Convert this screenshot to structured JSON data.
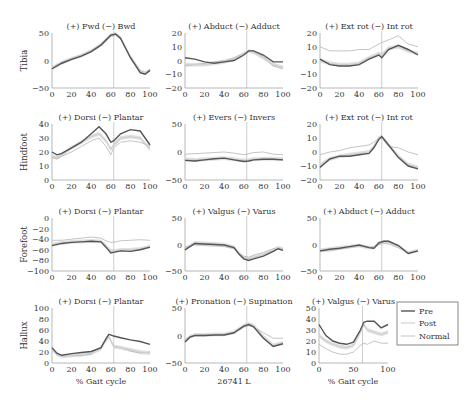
{
  "figure": {
    "row_labels": [
      "Tibia",
      "Hindfoot",
      "Forefoot",
      "Hallux"
    ],
    "x_label": "% Gait cycle",
    "center_caption": "26741 L",
    "legend": [
      {
        "label": "Pre",
        "color": "#555555"
      },
      {
        "label": "Post",
        "color": "#d0d0d0"
      },
      {
        "label": "Normal",
        "color": "#b5b5b5"
      }
    ],
    "toe_off_line_x": 63
  },
  "chart_data": [
    {
      "type": "line",
      "segment": "Tibia",
      "title": "(+) Fwd (−) Bwd",
      "xlabel": "",
      "ylabel": "Tibia",
      "xlim": [
        0,
        100
      ],
      "ylim": [
        -50,
        50
      ],
      "xticks": [
        0,
        20,
        40,
        60,
        80,
        100
      ],
      "yticks": [
        50,
        0,
        -50
      ],
      "x": [
        0,
        10,
        20,
        30,
        40,
        50,
        60,
        65,
        70,
        80,
        90,
        95,
        100
      ],
      "series": [
        {
          "name": "Pre",
          "values": [
            -15,
            -5,
            2,
            8,
            16,
            28,
            46,
            48,
            40,
            5,
            -22,
            -25,
            -18
          ]
        },
        {
          "name": "Post",
          "values": [
            -14,
            -4,
            3,
            9,
            17,
            29,
            46,
            48,
            41,
            6,
            -20,
            -23,
            -17
          ]
        },
        {
          "name": "Normal",
          "values": [
            -13,
            -3,
            4,
            10,
            18,
            30,
            45,
            47,
            40,
            8,
            -18,
            -22,
            -16
          ]
        }
      ]
    },
    {
      "type": "line",
      "segment": "Tibia",
      "title": "(+) Abduct (−) Adduct",
      "xlabel": "",
      "ylabel": "",
      "xlim": [
        0,
        100
      ],
      "ylim": [
        -20,
        20
      ],
      "xticks": [
        0,
        20,
        40,
        60,
        80,
        100
      ],
      "yticks": [
        20,
        10,
        0,
        -10,
        -20
      ],
      "x": [
        0,
        10,
        20,
        30,
        40,
        50,
        60,
        65,
        70,
        80,
        90,
        100
      ],
      "series": [
        {
          "name": "Pre",
          "values": [
            2,
            1,
            -1,
            -2,
            -1,
            0,
            4,
            7,
            7,
            4,
            -1,
            -1
          ]
        },
        {
          "name": "Post",
          "values": [
            -3,
            -3,
            -3,
            -2,
            -1,
            1,
            5,
            7,
            6,
            2,
            -3,
            -5
          ]
        },
        {
          "name": "Normal",
          "values": [
            -4,
            -3,
            -2,
            -1,
            0,
            2,
            5,
            7,
            7,
            3,
            -4,
            -6
          ]
        }
      ]
    },
    {
      "type": "line",
      "segment": "Tibia",
      "title": "(+) Ext rot (−) Int rot",
      "xlabel": "",
      "ylabel": "",
      "xlim": [
        0,
        100
      ],
      "ylim": [
        -20,
        20
      ],
      "xticks": [
        0,
        20,
        40,
        60,
        80,
        100
      ],
      "yticks": [
        20,
        10,
        0,
        -10,
        -20
      ],
      "x": [
        0,
        10,
        20,
        30,
        40,
        50,
        60,
        63,
        70,
        80,
        90,
        100
      ],
      "series": [
        {
          "name": "Pre",
          "values": [
            1,
            -3,
            -4,
            -4,
            -3,
            1,
            4,
            2,
            8,
            11,
            8,
            4
          ]
        },
        {
          "name": "Post",
          "values": [
            0,
            -2,
            -3,
            -3,
            -2,
            2,
            5,
            4,
            9,
            10,
            7,
            5
          ]
        },
        {
          "name": "Normal",
          "values": [
            10,
            7,
            7,
            7,
            8,
            8,
            12,
            13,
            15,
            18,
            12,
            10
          ]
        }
      ]
    },
    {
      "type": "line",
      "segment": "Hindfoot",
      "title": "(+) Dorsi (−) Plantar",
      "xlabel": "",
      "ylabel": "Hindfoot",
      "xlim": [
        0,
        100
      ],
      "ylim": [
        0,
        40
      ],
      "xticks": [
        0,
        20,
        40,
        60,
        80,
        100
      ],
      "yticks": [
        40,
        30,
        20,
        10,
        0
      ],
      "x": [
        0,
        5,
        10,
        20,
        30,
        40,
        48,
        55,
        60,
        63,
        70,
        80,
        90,
        100
      ],
      "series": [
        {
          "name": "Pre",
          "values": [
            20,
            18,
            19,
            23,
            27,
            33,
            38,
            33,
            27,
            28,
            33,
            36,
            35,
            25
          ]
        },
        {
          "name": "Post",
          "values": [
            17,
            16,
            18,
            23,
            27,
            31,
            33,
            28,
            22,
            25,
            30,
            31,
            30,
            22
          ]
        },
        {
          "name": "Normal",
          "values": [
            16,
            15,
            17,
            20,
            24,
            28,
            30,
            24,
            18,
            23,
            27,
            28,
            27,
            24
          ]
        }
      ]
    },
    {
      "type": "line",
      "segment": "Hindfoot",
      "title": "(+) Evers (−) Invers",
      "xlabel": "",
      "ylabel": "",
      "xlim": [
        0,
        100
      ],
      "ylim": [
        -50,
        50
      ],
      "xticks": [
        0,
        20,
        40,
        60,
        80,
        100
      ],
      "yticks": [
        50,
        0,
        -50
      ],
      "x": [
        0,
        10,
        20,
        30,
        40,
        50,
        60,
        65,
        70,
        80,
        90,
        100
      ],
      "series": [
        {
          "name": "Pre",
          "values": [
            -15,
            -16,
            -14,
            -12,
            -11,
            -14,
            -17,
            -16,
            -14,
            -13,
            -13,
            -14
          ]
        },
        {
          "name": "Post",
          "values": [
            -13,
            -14,
            -13,
            -12,
            -11,
            -13,
            -15,
            -14,
            -13,
            -12,
            -12,
            -13
          ]
        },
        {
          "name": "Normal",
          "values": [
            -4,
            -3,
            -2,
            -1,
            0,
            -2,
            -5,
            -3,
            -1,
            0,
            -4,
            -5
          ]
        }
      ]
    },
    {
      "type": "line",
      "segment": "Hindfoot",
      "title": "(+) Ext rot (−) Int rot",
      "xlabel": "",
      "ylabel": "",
      "xlim": [
        0,
        100
      ],
      "ylim": [
        -20,
        20
      ],
      "xticks": [
        0,
        20,
        40,
        60,
        80,
        100
      ],
      "yticks": [
        20,
        10,
        0,
        -10,
        -20
      ],
      "x": [
        0,
        5,
        10,
        20,
        30,
        40,
        50,
        55,
        60,
        63,
        70,
        80,
        90,
        100
      ],
      "series": [
        {
          "name": "Pre",
          "values": [
            -11,
            -8,
            -5,
            -3,
            -3,
            -2,
            -1,
            3,
            9,
            11,
            5,
            -4,
            -10,
            -12
          ]
        },
        {
          "name": "Post",
          "values": [
            -10,
            -7,
            -5,
            -3,
            -2,
            -1,
            0,
            4,
            10,
            11,
            5,
            -3,
            -9,
            -11
          ]
        },
        {
          "name": "Normal",
          "values": [
            -2,
            -1,
            0,
            1,
            3,
            4,
            5,
            7,
            10,
            10,
            4,
            3,
            0,
            -2
          ]
        }
      ]
    },
    {
      "type": "line",
      "segment": "Forefoot",
      "title": "(+) Dorsi (−) Plantar",
      "xlabel": "",
      "ylabel": "Forefoot",
      "xlim": [
        0,
        100
      ],
      "ylim": [
        -100,
        0
      ],
      "xticks": [
        0,
        20,
        40,
        60,
        80,
        100
      ],
      "yticks": [
        0,
        -20,
        -40,
        -60,
        -80,
        -100
      ],
      "x": [
        0,
        10,
        20,
        30,
        40,
        50,
        55,
        60,
        65,
        70,
        80,
        90,
        100
      ],
      "series": [
        {
          "name": "Pre",
          "values": [
            -52,
            -48,
            -46,
            -45,
            -44,
            -45,
            -55,
            -66,
            -64,
            -62,
            -63,
            -60,
            -55
          ]
        },
        {
          "name": "Post",
          "values": [
            -50,
            -47,
            -45,
            -44,
            -43,
            -44,
            -52,
            -62,
            -62,
            -60,
            -60,
            -58,
            -54
          ]
        },
        {
          "name": "Normal",
          "values": [
            -42,
            -42,
            -40,
            -38,
            -36,
            -38,
            -43,
            -46,
            -45,
            -43,
            -42,
            -41,
            -42
          ]
        }
      ]
    },
    {
      "type": "line",
      "segment": "Forefoot",
      "title": "(+) Valgus (−) Varus",
      "xlabel": "",
      "ylabel": "",
      "xlim": [
        0,
        100
      ],
      "ylim": [
        -50,
        50
      ],
      "xticks": [
        0,
        20,
        40,
        60,
        80,
        100
      ],
      "yticks": [
        50,
        0,
        -50
      ],
      "x": [
        0,
        10,
        20,
        30,
        40,
        50,
        55,
        60,
        65,
        70,
        80,
        90,
        95,
        100
      ],
      "series": [
        {
          "name": "Pre",
          "values": [
            -10,
            2,
            1,
            0,
            -1,
            -6,
            -18,
            -27,
            -30,
            -27,
            -22,
            -13,
            -8,
            -11
          ]
        },
        {
          "name": "Post",
          "values": [
            -8,
            3,
            2,
            1,
            0,
            -5,
            -16,
            -25,
            -27,
            -24,
            -19,
            -11,
            -6,
            -9
          ]
        },
        {
          "name": "Normal",
          "values": [
            -5,
            -1,
            -2,
            -3,
            -4,
            -8,
            -17,
            -22,
            -24,
            -20,
            -15,
            -8,
            -6,
            -8
          ]
        }
      ]
    },
    {
      "type": "line",
      "segment": "Forefoot",
      "title": "(+) Abduct (−) Adduct",
      "xlabel": "",
      "ylabel": "",
      "xlim": [
        0,
        100
      ],
      "ylim": [
        -50,
        50
      ],
      "xticks": [
        0,
        20,
        40,
        60,
        80,
        100
      ],
      "yticks": [
        50,
        0,
        -50
      ],
      "x": [
        0,
        10,
        20,
        30,
        40,
        50,
        55,
        60,
        65,
        70,
        80,
        90,
        100
      ],
      "series": [
        {
          "name": "Pre",
          "values": [
            -12,
            -9,
            -7,
            -4,
            -1,
            -6,
            -7,
            3,
            6,
            6,
            -2,
            -17,
            -12
          ]
        },
        {
          "name": "Post",
          "values": [
            -11,
            -8,
            -6,
            -4,
            -2,
            -6,
            -6,
            2,
            5,
            5,
            -3,
            -16,
            -11
          ]
        },
        {
          "name": "Normal",
          "values": [
            -13,
            -12,
            -9,
            -6,
            -3,
            -5,
            -5,
            0,
            2,
            1,
            -6,
            -16,
            -12
          ]
        }
      ]
    },
    {
      "type": "line",
      "segment": "Hallux",
      "title": "(+) Dorsi (−) Plantar",
      "xlabel": "% Gait cycle",
      "ylabel": "Hallux",
      "xlim": [
        0,
        100
      ],
      "ylim": [
        0,
        100
      ],
      "xticks": [
        0,
        20,
        40,
        60,
        80,
        100
      ],
      "yticks": [
        100,
        80,
        60,
        40,
        20,
        0
      ],
      "x": [
        0,
        5,
        10,
        20,
        30,
        40,
        50,
        55,
        58,
        63,
        70,
        80,
        90,
        100
      ],
      "series": [
        {
          "name": "Pre",
          "values": [
            28,
            18,
            14,
            17,
            19,
            21,
            28,
            44,
            52,
            49,
            46,
            42,
            39,
            34
          ]
        },
        {
          "name": "Post",
          "values": [
            26,
            16,
            12,
            14,
            15,
            18,
            26,
            42,
            48,
            30,
            28,
            24,
            20,
            18
          ]
        },
        {
          "name": "Normal",
          "values": [
            25,
            15,
            13,
            13,
            14,
            16,
            28,
            40,
            47,
            30,
            28,
            22,
            18,
            20
          ]
        }
      ]
    },
    {
      "type": "line",
      "segment": "Hallux",
      "title": "(+) Pronation (−) Supination",
      "xlabel": "26741 L",
      "ylabel": "",
      "xlim": [
        0,
        100
      ],
      "ylim": [
        -50,
        50
      ],
      "xticks": [
        0,
        20,
        40,
        60,
        80,
        100
      ],
      "yticks": [
        50,
        0,
        -50
      ],
      "x": [
        0,
        5,
        10,
        20,
        30,
        40,
        50,
        60,
        65,
        70,
        80,
        90,
        100
      ],
      "series": [
        {
          "name": "Pre",
          "values": [
            -12,
            -3,
            0,
            0,
            1,
            1,
            5,
            17,
            20,
            16,
            -5,
            -20,
            -15
          ]
        },
        {
          "name": "Post",
          "values": [
            -10,
            -2,
            1,
            1,
            2,
            2,
            6,
            18,
            21,
            18,
            -2,
            -18,
            -13
          ]
        },
        {
          "name": "Normal",
          "values": [
            -8,
            -2,
            0,
            1,
            1,
            2,
            5,
            15,
            18,
            15,
            5,
            -5,
            -5
          ]
        }
      ]
    },
    {
      "type": "line",
      "segment": "Hallux",
      "title": "(+) Valgus (−) Varus",
      "xlabel": "% Gait cycle",
      "ylabel": "",
      "xlim": [
        0,
        100
      ],
      "ylim": [
        0,
        50
      ],
      "xticks": [
        0,
        50,
        100
      ],
      "yticks": [
        50,
        40,
        30,
        20,
        10,
        0
      ],
      "x": [
        0,
        10,
        20,
        30,
        40,
        50,
        60,
        65,
        70,
        80,
        90,
        100
      ],
      "series": [
        {
          "name": "Pre",
          "values": [
            35,
            25,
            20,
            18,
            17,
            19,
            30,
            37,
            38,
            38,
            32,
            35
          ]
        },
        {
          "name": "Post",
          "values": [
            25,
            20,
            17,
            15,
            14,
            16,
            28,
            35,
            30,
            28,
            26,
            28
          ]
        },
        {
          "name": "Normal",
          "values": [
            17,
            13,
            10,
            8,
            8,
            10,
            16,
            18,
            17,
            20,
            18,
            18
          ]
        }
      ]
    }
  ]
}
